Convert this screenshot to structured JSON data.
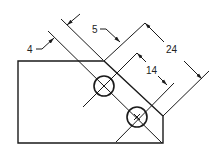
{
  "diagram": {
    "type": "engineering-drawing",
    "stroke_color": "#1a1a1a",
    "background": "#ffffff",
    "dimensions": {
      "d4": "4",
      "d5": "5",
      "d14": "14",
      "d24": "24"
    },
    "holes": [
      {
        "cx": 104,
        "cy": 86,
        "r": 10
      },
      {
        "cx": 137,
        "cy": 117,
        "r": 10
      }
    ]
  }
}
